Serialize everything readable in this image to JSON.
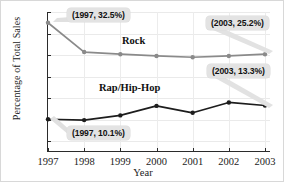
{
  "chart_data": {
    "type": "line",
    "title": "",
    "xlabel": "Year",
    "ylabel": "Percentage of Total Sales",
    "categories": [
      "1997",
      "1998",
      "1999",
      "2000",
      "2001",
      "2002",
      "2003"
    ],
    "x": [
      1997,
      1998,
      1999,
      2000,
      2001,
      2002,
      2003
    ],
    "xlim": [
      1997,
      2003
    ],
    "ylim": [
      2.5,
      35
    ],
    "yticks": [
      "5%",
      "10%",
      "15%",
      "20%",
      "25%",
      "30%",
      "35%"
    ],
    "ytick_values": [
      5,
      10,
      15,
      20,
      25,
      30,
      35
    ],
    "grid": true,
    "legend_position": "inline-labels",
    "series": [
      {
        "name": "Rock",
        "color": "#8a8a8a",
        "marker_color": "#8a8a8a",
        "values": [
          32.5,
          25.7,
          25.2,
          24.8,
          24.5,
          24.8,
          25.2
        ]
      },
      {
        "name": "Rap/Hip-Hop",
        "color": "#1d1d1d",
        "marker_color": "#1d1d1d",
        "values": [
          10.1,
          9.9,
          11.0,
          13.2,
          11.6,
          14.0,
          13.3
        ]
      }
    ],
    "annotations": [
      {
        "id": "rock-1997",
        "label": "(1997, 32.5%)",
        "series": "Rock",
        "x": 1997,
        "y": 32.5
      },
      {
        "id": "rock-2003",
        "label": "(2003, 25.2%)",
        "series": "Rock",
        "x": 2003,
        "y": 25.2
      },
      {
        "id": "rap-2003",
        "label": "(2003, 13.3%)",
        "series": "Rap/Hip-Hop",
        "x": 2003,
        "y": 13.3
      },
      {
        "id": "rap-1997",
        "label": "(1997, 10.1%)",
        "series": "Rap/Hip-Hop",
        "x": 1997,
        "y": 10.1
      }
    ]
  },
  "axes": {
    "ylabel": "Percentage of Total Sales",
    "xlabel": "Year",
    "ytick_labels": [
      "35%",
      "30%",
      "25%",
      "20%",
      "15%",
      "10%",
      "5%"
    ],
    "xtick_labels": [
      "1997",
      "1998",
      "1999",
      "2000",
      "2001",
      "2002",
      "2003"
    ]
  },
  "series_labels": {
    "rock": "Rock",
    "rap": "Rap/Hip-Hop"
  },
  "callouts": {
    "rock_1997": "(1997, 32.5%)",
    "rock_2003": "(2003, 25.2%)",
    "rap_2003": "(2003, 13.3%)",
    "rap_1997": "(1997, 10.1%)"
  },
  "colors": {
    "rock_line": "#8a8a8a",
    "rap_line": "#1d1d1d",
    "axis": "#2b2b2b",
    "grid": "#ebebeb",
    "callout_bg": "#e3e3e3",
    "background": "#ffffff"
  }
}
